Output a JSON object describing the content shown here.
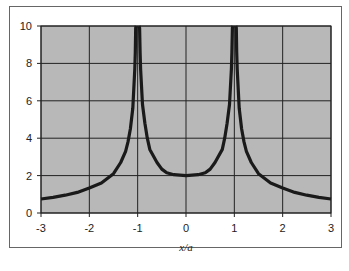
{
  "chart_data": {
    "type": "line",
    "title": "",
    "xlabel": "x/a",
    "ylabel": "",
    "xlim": [
      -3,
      3
    ],
    "ylim": [
      0,
      10
    ],
    "x_ticks": [
      "-3",
      "-2",
      "-1",
      "0",
      "1",
      "2",
      "3"
    ],
    "y_ticks": [
      "0",
      "2",
      "4",
      "6",
      "8",
      "10"
    ],
    "grid": true,
    "legend": null,
    "plot_background": "#b8b8b8",
    "line_color": "#1a1a1a",
    "series": [
      {
        "name": "curve",
        "x": [
          -3,
          -2.75,
          -2.5,
          -2.25,
          -2,
          -1.75,
          -1.5,
          -1.35,
          -1.25,
          -1.2,
          -1.15,
          -1.1,
          -1.06,
          -1.05,
          -1.04,
          -1.03,
          -0.97,
          -0.96,
          -0.95,
          -0.94,
          -0.9,
          -0.85,
          -0.8,
          -0.75,
          -0.6,
          -0.5,
          -0.4,
          -0.25,
          0,
          0.25,
          0.4,
          0.5,
          0.6,
          0.75,
          0.8,
          0.85,
          0.9,
          0.94,
          0.95,
          0.96,
          0.97,
          1.03,
          1.04,
          1.05,
          1.06,
          1.1,
          1.15,
          1.2,
          1.25,
          1.35,
          1.5,
          1.75,
          2,
          2.25,
          2.5,
          2.75,
          3
        ],
        "y": [
          0.75,
          0.84,
          0.95,
          1.1,
          1.33,
          1.6,
          2.1,
          2.7,
          3.3,
          3.8,
          4.5,
          5.6,
          7.7,
          8.6,
          9.9,
          10,
          10,
          9.9,
          8.6,
          7.7,
          5.8,
          4.8,
          4.0,
          3.4,
          2.7,
          2.35,
          2.15,
          2.05,
          2.0,
          2.05,
          2.15,
          2.35,
          2.7,
          3.4,
          4.0,
          4.8,
          5.8,
          7.7,
          8.6,
          9.9,
          10,
          10,
          9.9,
          8.6,
          7.7,
          5.6,
          4.5,
          3.8,
          3.3,
          2.7,
          2.1,
          1.6,
          1.33,
          1.1,
          0.95,
          0.84,
          0.75
        ]
      }
    ]
  },
  "layout": {
    "plot_left": 41,
    "plot_right": 331,
    "plot_top": 26,
    "plot_bottom": 213
  }
}
